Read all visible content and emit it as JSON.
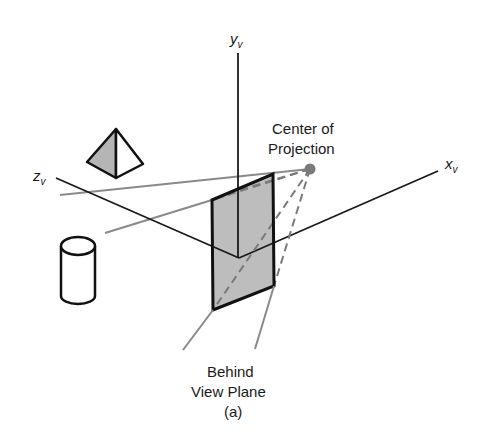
{
  "diagram": {
    "type": "3d-viewing-projection",
    "axes": {
      "y": {
        "label": "y",
        "subscript": "v"
      },
      "x": {
        "label": "x",
        "subscript": "v"
      },
      "z": {
        "label": "z",
        "subscript": "v"
      }
    },
    "labels": {
      "cop_line1": "Center of",
      "cop_line2": "Projection",
      "behind_line1": "Behind",
      "behind_line2": "View Plane",
      "caption": "(a)"
    },
    "objects": [
      "pyramid",
      "cylinder",
      "view-plane",
      "center-of-projection"
    ],
    "colors": {
      "line": "#1a1a1a",
      "projector": "#808080",
      "plane_fill": "#bdbdbd",
      "pyramid_fill": "#b5b5b5",
      "cop_dot": "#7a7a7a"
    }
  }
}
